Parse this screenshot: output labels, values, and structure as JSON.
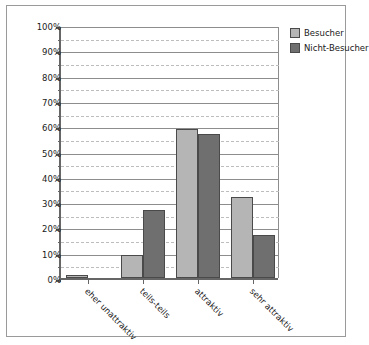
{
  "chart_data": {
    "type": "bar",
    "title": "",
    "xlabel": "",
    "ylabel": "",
    "ylim": [
      0,
      100
    ],
    "y_unit": "%",
    "grid": true,
    "legend_position": "top-right",
    "categories": [
      "eher unattraktiv",
      "teils-teils",
      "attraktiv",
      "sehr attraktiv"
    ],
    "series": [
      {
        "name": "Besucher",
        "color": "#b5b5b5",
        "values": [
          1,
          9,
          59,
          32
        ]
      },
      {
        "name": "Nicht-Besucher",
        "color": "#6f6f6f",
        "values": [
          0,
          27,
          57,
          17
        ]
      }
    ],
    "y_ticks": [
      "0%",
      "10%",
      "20%",
      "30%",
      "40%",
      "50%",
      "60%",
      "70%",
      "80%",
      "90%",
      "100%"
    ],
    "y_tick_values": [
      0,
      10,
      20,
      30,
      40,
      50,
      60,
      70,
      80,
      90,
      100
    ],
    "y_minor_tick_values": [
      5,
      15,
      25,
      35,
      45,
      55,
      65,
      75,
      85,
      95
    ]
  },
  "legend": {
    "items": [
      {
        "label": "Besucher"
      },
      {
        "label": "Nicht-Besucher"
      }
    ]
  }
}
